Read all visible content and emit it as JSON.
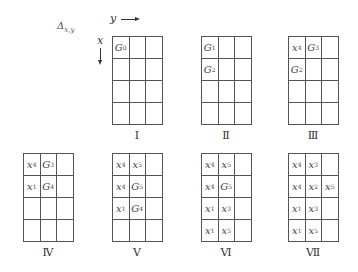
{
  "axis": {
    "delta_symbol": "Δ",
    "delta_subscript": "x,y",
    "y_label": "y",
    "x_label": "x"
  },
  "grids": [
    {
      "label": "Ⅰ",
      "cells": [
        [
          "G0",
          "",
          ""
        ],
        [
          "",
          "",
          ""
        ],
        [
          "",
          "",
          ""
        ],
        [
          "",
          "",
          ""
        ]
      ]
    },
    {
      "label": "Ⅱ",
      "cells": [
        [
          "G1",
          "",
          ""
        ],
        [
          "G2",
          "",
          ""
        ],
        [
          "",
          "",
          ""
        ],
        [
          "",
          "",
          ""
        ]
      ]
    },
    {
      "label": "Ⅲ",
      "cells": [
        [
          "x4",
          "G3",
          ""
        ],
        [
          "G2",
          "",
          ""
        ],
        [
          "",
          "",
          ""
        ],
        [
          "",
          "",
          ""
        ]
      ]
    },
    {
      "label": "Ⅳ",
      "cells": [
        [
          "x4",
          "G3",
          ""
        ],
        [
          "x1",
          "G4",
          ""
        ],
        [
          "",
          "",
          ""
        ],
        [
          "",
          "",
          ""
        ]
      ]
    },
    {
      "label": "Ⅴ",
      "cells": [
        [
          "x4",
          "x5",
          ""
        ],
        [
          "x4",
          "G5",
          ""
        ],
        [
          "x1",
          "G4",
          ""
        ],
        [
          "",
          "",
          ""
        ]
      ]
    },
    {
      "label": "Ⅵ",
      "cells": [
        [
          "x4",
          "x5",
          ""
        ],
        [
          "x4",
          "G5",
          ""
        ],
        [
          "x1",
          "x3",
          ""
        ],
        [
          "x1",
          "x5",
          ""
        ]
      ]
    },
    {
      "label": "Ⅶ",
      "cells": [
        [
          "x4",
          "x3",
          ""
        ],
        [
          "x4",
          "x2",
          "x5"
        ],
        [
          "x1",
          "x3",
          ""
        ],
        [
          "x1",
          "x5",
          ""
        ]
      ]
    }
  ]
}
